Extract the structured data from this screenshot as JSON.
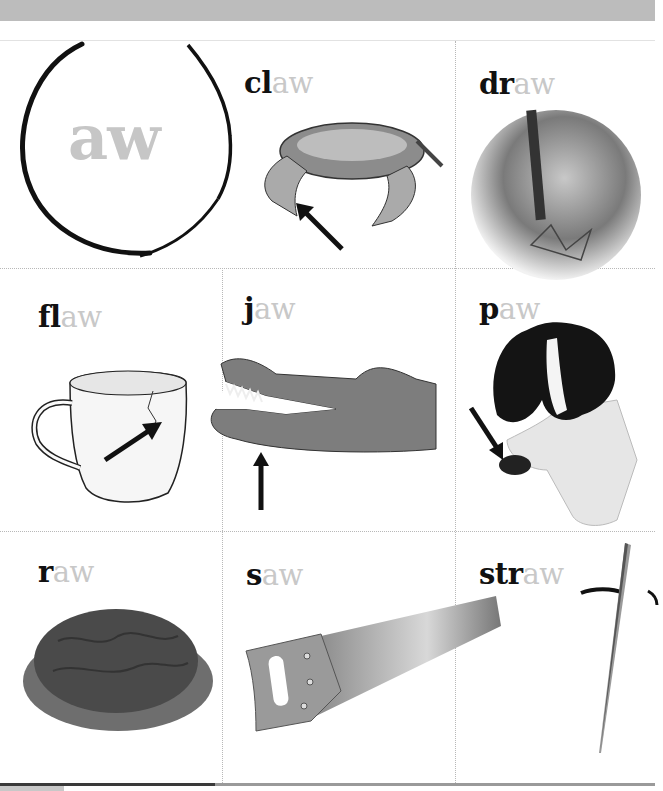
{
  "header": {
    "bar_color": "#bcbcbc"
  },
  "title_card": {
    "label": "aw",
    "label_color": "#c6c6c6"
  },
  "cards": [
    {
      "id": "claw",
      "onset": "cl",
      "rime": "aw",
      "picture": "crab with arrow pointing to claw"
    },
    {
      "id": "draw",
      "onset": "dr",
      "rime": "aw",
      "picture": "hand drawing with pencil"
    },
    {
      "id": "flaw",
      "onset": "fl",
      "rime": "aw",
      "picture": "cracked mug with arrow pointing to crack"
    },
    {
      "id": "jaw",
      "onset": "j",
      "rime": "aw",
      "picture": "crocodile head with arrow pointing to jaw"
    },
    {
      "id": "paw",
      "onset": "p",
      "rime": "aw",
      "picture": "spaniel dog raising paw with arrow"
    },
    {
      "id": "raw",
      "onset": "r",
      "rime": "aw",
      "picture": "raw ground meat on lettuce"
    },
    {
      "id": "saw",
      "onset": "s",
      "rime": "aw",
      "picture": "hand saw"
    },
    {
      "id": "straw",
      "onset": "str",
      "rime": "aw",
      "picture": "drinking straw in glass"
    }
  ],
  "colors": {
    "onset": "#111111",
    "rime": "#c8c8c8",
    "grid": "#b8b8b8"
  }
}
